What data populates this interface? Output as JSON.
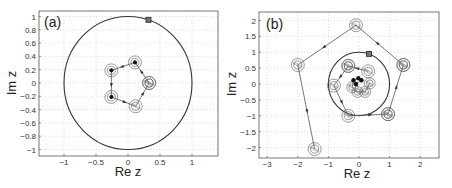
{
  "figure": {
    "panels": [
      {
        "label": "(a)",
        "xlabel": "Re z",
        "ylabel": "Im z"
      },
      {
        "label": "(b)",
        "xlabel": "Re z",
        "ylabel": "Im z"
      }
    ]
  },
  "chart_data": [
    {
      "type": "scatter",
      "title": "(a)",
      "xlabel": "Re z",
      "ylabel": "Im z",
      "xlim": [
        -1.4,
        1.4
      ],
      "ylim": [
        -1.1,
        1.1
      ],
      "xticks": [
        -1,
        -0.5,
        0,
        0.5,
        1
      ],
      "xtick_labels": [
        "-1",
        "-0.5",
        "0",
        "0.5",
        "1"
      ],
      "yticks": [
        1,
        0.8,
        0.6,
        0.4,
        0.2,
        0,
        -0.2,
        -0.4,
        -0.6,
        -0.8,
        -1
      ],
      "ytick_labels": [
        "1",
        "0.8",
        "0.6",
        "0.4",
        "0.2",
        "0",
        "-0.2",
        "-0.4",
        "-0.6",
        "-0.8",
        "-1"
      ],
      "grid": true,
      "unit_circle": true,
      "start_marker": {
        "shape": "square",
        "x": 0.32,
        "y": 0.95
      },
      "trajectory": [
        {
          "x": 0.33,
          "y": 0.0,
          "style": "hatched"
        },
        {
          "x": 0.11,
          "y": 0.31,
          "style": "filled"
        },
        {
          "x": -0.26,
          "y": 0.19,
          "style": "filled"
        },
        {
          "x": -0.26,
          "y": -0.21,
          "style": "filled"
        },
        {
          "x": 0.12,
          "y": -0.35,
          "style": "hatched"
        },
        {
          "x": 0.33,
          "y": 0.0,
          "style": "hatched"
        }
      ]
    },
    {
      "type": "scatter",
      "title": "(b)",
      "xlabel": "Re z",
      "ylabel": "Im z",
      "xlim": [
        -3.3,
        2.6
      ],
      "ylim": [
        -2.25,
        2.25
      ],
      "xticks": [
        -3,
        -2,
        -1,
        0,
        1,
        2
      ],
      "xtick_labels": [
        "-3",
        "-2",
        "-1",
        "0",
        "1",
        "2"
      ],
      "yticks": [
        2,
        1.5,
        1,
        0.5,
        0,
        -0.5,
        -1,
        -1.5,
        -2
      ],
      "ytick_labels": [
        "2",
        "1.5",
        "1",
        "0.5",
        "0",
        "-0.5",
        "-1",
        "-1.5",
        "-2"
      ],
      "grid": true,
      "unit_circle": true,
      "start_marker": {
        "shape": "square",
        "x": 0.33,
        "y": 0.95
      },
      "trajectory": [
        {
          "x": 1.45,
          "y": 0.6,
          "style": "hatched"
        },
        {
          "x": -0.1,
          "y": 1.85,
          "style": "hatched"
        },
        {
          "x": -2.0,
          "y": 0.6,
          "style": "hatched"
        },
        {
          "x": -1.45,
          "y": -2.05,
          "style": "hatched"
        }
      ],
      "trajectory_inner": [
        {
          "x": 0.95,
          "y": -0.95,
          "style": "hatched"
        },
        {
          "x": 1.45,
          "y": 0.6,
          "style": "hatched"
        }
      ],
      "trajectory_mid": [
        {
          "x": -0.35,
          "y": 0.57,
          "style": "hatched"
        },
        {
          "x": -0.82,
          "y": -0.05,
          "style": "hatched"
        },
        {
          "x": -0.35,
          "y": -1.0,
          "style": "hatched"
        },
        {
          "x": 0.95,
          "y": -0.95,
          "style": "hatched"
        }
      ],
      "trajectory_core": [
        {
          "x": 0.3,
          "y": 0.4,
          "style": "hatched"
        },
        {
          "x": -0.35,
          "y": 0.57,
          "style": "hatched"
        }
      ],
      "cluster": [
        {
          "x": 0.35,
          "y": 0.02,
          "style": "hatched"
        },
        {
          "x": 0.2,
          "y": -0.25,
          "style": "hatched"
        },
        {
          "x": -0.05,
          "y": -0.25,
          "style": "hatched"
        },
        {
          "x": -0.22,
          "y": -0.1,
          "style": "hatched"
        },
        {
          "x": -0.18,
          "y": 0.12,
          "style": "filled"
        },
        {
          "x": -0.02,
          "y": 0.18,
          "style": "filled"
        },
        {
          "x": 0.08,
          "y": 0.12,
          "style": "filled"
        },
        {
          "x": -0.1,
          "y": 0.0,
          "style": "filled"
        }
      ]
    }
  ]
}
